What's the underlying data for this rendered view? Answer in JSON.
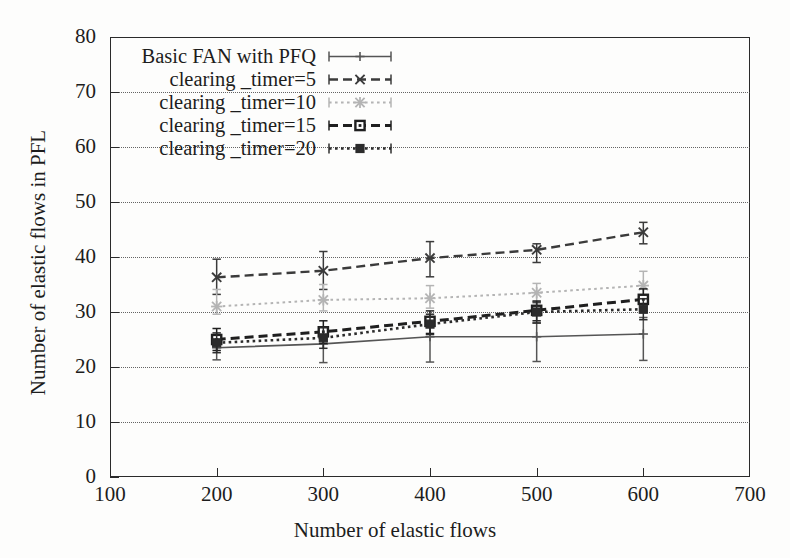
{
  "figure": {
    "xlabel": "Number of elastic flows",
    "ylabel": "Number of elastic flows in PFL"
  },
  "axes": {
    "x_ticks": [
      "100",
      "200",
      "300",
      "400",
      "500",
      "600",
      "700"
    ],
    "y_ticks": [
      "0",
      "10",
      "20",
      "30",
      "40",
      "50",
      "60",
      "70",
      "80"
    ]
  },
  "legend": {
    "items": [
      {
        "label": "Basic FAN with PFQ",
        "key": "plus-marker-solid-line"
      },
      {
        "label": "clearing _timer=5",
        "key": "cross-marker-dashed-line"
      },
      {
        "label": "clearing _timer=10",
        "key": "star-marker-dotted-line-gray"
      },
      {
        "label": "clearing _timer=15",
        "key": "open-square-marker-dashed-line"
      },
      {
        "label": "clearing _timer=20",
        "key": "filled-square-marker-dotted-line"
      }
    ]
  },
  "chart_data": {
    "type": "line",
    "title": "",
    "xlabel": "Number of elastic flows",
    "ylabel": "Number of elastic flows in PFL",
    "xlim": [
      100,
      700
    ],
    "ylim": [
      0,
      80
    ],
    "xticks": [
      100,
      200,
      300,
      400,
      500,
      600,
      700
    ],
    "yticks": [
      0,
      10,
      20,
      30,
      40,
      50,
      60,
      70,
      80
    ],
    "grid": true,
    "legend_position": "top-left-inside",
    "x": [
      200,
      300,
      400,
      500,
      600
    ],
    "series": [
      {
        "name": "Basic FAN with PFQ",
        "marker": "plus",
        "linestyle": "solid",
        "color": "#555555",
        "values": [
          23.5,
          24.2,
          25.5,
          25.5,
          26.0
        ],
        "err_low": [
          21.3,
          20.8,
          20.9,
          21.0,
          21.2
        ],
        "err_high": [
          25.6,
          26.4,
          27.9,
          28.0,
          29.0
        ]
      },
      {
        "name": "clearing _timer=5",
        "marker": "cross",
        "linestyle": "dashed",
        "color": "#3b3b3b",
        "values": [
          36.3,
          37.5,
          39.8,
          41.3,
          44.5
        ],
        "err_low": [
          33.2,
          34.1,
          36.4,
          39.0,
          42.4
        ],
        "err_high": [
          39.6,
          41.0,
          42.8,
          42.4,
          46.3
        ]
      },
      {
        "name": "clearing _timer=10",
        "marker": "star",
        "linestyle": "dotted",
        "color": "#b4b4b4",
        "values": [
          31.0,
          32.2,
          32.5,
          33.5,
          34.8
        ],
        "err_low": [
          29.6,
          30.2,
          30.7,
          31.6,
          32.6
        ],
        "err_high": [
          34.1,
          35.0,
          34.8,
          35.2,
          37.4
        ]
      },
      {
        "name": "clearing _timer=15",
        "marker": "open-square",
        "linestyle": "dashed",
        "color": "#1f1f1f",
        "values": [
          25.0,
          26.4,
          28.3,
          30.3,
          32.3
        ],
        "err_low": [
          23.0,
          24.3,
          26.1,
          28.4,
          30.2
        ],
        "err_high": [
          27.0,
          28.4,
          30.2,
          32.0,
          34.2
        ]
      },
      {
        "name": "clearing _timer=20",
        "marker": "filled-square",
        "linestyle": "dotted",
        "color": "#2c2c2c",
        "values": [
          24.4,
          25.3,
          27.8,
          30.0,
          30.5
        ],
        "err_low": [
          22.6,
          23.4,
          25.9,
          28.0,
          28.6
        ],
        "err_high": [
          26.2,
          27.2,
          29.6,
          31.8,
          32.4
        ]
      }
    ]
  }
}
